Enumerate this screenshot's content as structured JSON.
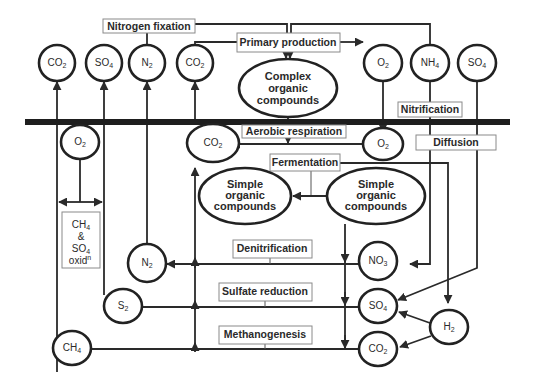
{
  "processes": {
    "nitrogen_fixation": "Nitrogen fixation",
    "primary_production": "Primary production",
    "nitrification": "Nitrification",
    "aerobic_respiration": "Aerobic respiration",
    "diffusion": "Diffusion",
    "fermentation": "Fermentation",
    "denitrification": "Denitrification",
    "sulfate_reduction": "Sulfate reduction",
    "methanogenesis": "Methanogenesis",
    "ch4_so4_oxidation": [
      "CH",
      "&",
      "SO",
      "oxid"
    ],
    "ch4_so4_oxidation_subs": {
      "ch": "4",
      "so": "4",
      "oxid": "n"
    }
  },
  "nodes": {
    "top_co2_left": {
      "base": "CO",
      "sub": "2"
    },
    "top_so4": {
      "base": "SO",
      "sub": "4"
    },
    "top_n2": {
      "base": "N",
      "sub": "2"
    },
    "top_co2_mid": {
      "base": "CO",
      "sub": "2"
    },
    "top_o2": {
      "base": "O",
      "sub": "2"
    },
    "top_nh4": {
      "base": "NH",
      "sub": "4"
    },
    "top_so4_right": {
      "base": "SO",
      "sub": "4"
    },
    "sed_o2_left": {
      "base": "O",
      "sub": "2"
    },
    "sed_co2": {
      "base": "CO",
      "sub": "2"
    },
    "sed_o2_right": {
      "base": "O",
      "sub": "2"
    },
    "n2_low": {
      "base": "N",
      "sub": "2"
    },
    "s2": {
      "base": "S",
      "sub": "2"
    },
    "ch4": {
      "base": "CH",
      "sub": "4"
    },
    "no3": {
      "base": "NO",
      "sub": "3"
    },
    "so4_low": {
      "base": "SO",
      "sub": "4"
    },
    "co2_low": {
      "base": "CO",
      "sub": "2"
    },
    "h2": {
      "base": "H",
      "sub": "2"
    }
  },
  "compounds": {
    "complex": [
      "Complex",
      "organic",
      "compounds"
    ],
    "simple_left": [
      "Simple",
      "organic",
      "compounds"
    ],
    "simple_right": [
      "Simple",
      "organic",
      "compounds"
    ]
  }
}
